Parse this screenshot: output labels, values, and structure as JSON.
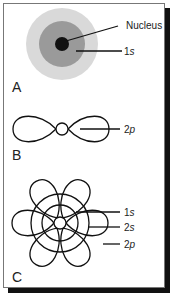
{
  "figure": {
    "panels": [
      {
        "id": "A",
        "label": "A",
        "description": "1s orbital shown as concentric shaded spheres around nucleus",
        "callouts": [
          {
            "text": "Nucleus"
          },
          {
            "num": "1",
            "orb": "s"
          }
        ],
        "colors": {
          "outer": "#d9d9d9",
          "inner": "#9a9a9a",
          "nucleus": "#111111"
        }
      },
      {
        "id": "B",
        "label": "B",
        "description": "single 2p orbital dumbbell",
        "callouts": [
          {
            "num": "2",
            "orb": "p"
          }
        ]
      },
      {
        "id": "C",
        "label": "C",
        "description": "combined 1s, 2s and three 2p orbitals",
        "callouts": [
          {
            "num": "1",
            "orb": "s"
          },
          {
            "num": "2",
            "orb": "s"
          },
          {
            "num": "2",
            "orb": "p"
          }
        ]
      }
    ]
  }
}
